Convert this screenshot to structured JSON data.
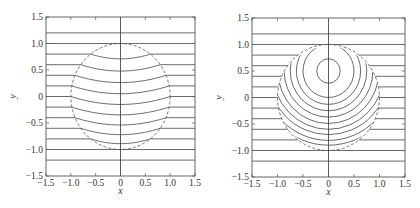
{
  "chart_data": [
    {
      "type": "line",
      "title": "",
      "xlabel": "x",
      "ylabel": "y",
      "xlim": [
        -1.5,
        1.5
      ],
      "ylim": [
        -1.5,
        1.5
      ],
      "xticks": [
        "-1.5",
        "-1.0",
        "-0.5",
        "0",
        "0.5",
        "1.0",
        "1.5"
      ],
      "yticks": [
        "1.5",
        "1.0",
        "0.5",
        "0",
        "-0.5",
        "-1.0",
        "-1.5"
      ],
      "grid": false,
      "boundary": {
        "shape": "circle",
        "center": [
          0,
          0
        ],
        "radius": 1.0,
        "style": "dashed"
      },
      "outside_lines_y": [
        1.2,
        1.0,
        0.8,
        0.6,
        0.4,
        0.2,
        0.0,
        -0.2,
        -0.4,
        -0.6,
        -0.8,
        -1.0,
        -1.2
      ],
      "inside_curve_shape": "U-shaped arcs continuous with outside horizontal lines, sag ~0.15 at x=0",
      "inside_sag": 0.15,
      "vertical_axis_line_x": 0
    },
    {
      "type": "line",
      "title": "",
      "xlabel": "x",
      "ylabel": "y",
      "xlim": [
        -1.5,
        1.5
      ],
      "ylim": [
        -1.5,
        1.5
      ],
      "xticks": [
        "-1.5",
        "-1.0",
        "-0.5",
        "0",
        "0.5",
        "1.0",
        "1.5"
      ],
      "yticks": [
        "1.5",
        "1.0",
        "0.5",
        "0",
        "-0.5",
        "-1.0",
        "-1.5"
      ],
      "grid": false,
      "boundary": {
        "shape": "circle",
        "center": [
          0,
          0
        ],
        "radius": 1.0,
        "style": "dashed"
      },
      "outside_lines_y": [
        1.2,
        1.0,
        0.8,
        0.6,
        0.4,
        0.2,
        0.0,
        -0.2,
        -0.4,
        -0.6,
        -0.8,
        -1.0,
        -1.2
      ],
      "inside_circles": {
        "center": [
          0,
          0.5
        ],
        "radii": [
          0.23,
          0.5,
          0.63,
          0.75,
          0.87,
          0.99,
          1.1,
          1.2,
          1.31,
          1.4
        ]
      },
      "vertical_axis_line_x": 0
    }
  ],
  "plots": [
    {
      "box": {
        "x": 46,
        "y": 17,
        "w": 149,
        "h": 159
      }
    },
    {
      "box": {
        "x": 252,
        "y": 18,
        "w": 153,
        "h": 159
      }
    }
  ]
}
